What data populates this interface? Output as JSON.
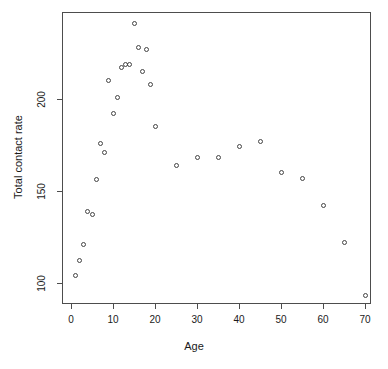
{
  "chart_data": {
    "type": "scatter",
    "title": "",
    "xlabel": "Age",
    "ylabel": "Total contact rate",
    "xlim": [
      -1.5,
      72.5
    ],
    "ylim": [
      88,
      245
    ],
    "grid": false,
    "legend": null,
    "xticks": [
      0,
      10,
      20,
      30,
      40,
      50,
      60,
      70
    ],
    "xtick_labels": [
      "0",
      "10",
      "20",
      "30",
      "40",
      "50",
      "60",
      "70"
    ],
    "yticks": [
      100,
      150,
      200
    ],
    "ytick_labels": [
      "100",
      "150",
      "200"
    ],
    "marker": "open-circle",
    "marker_color": "#444444",
    "points": [
      {
        "x": 1,
        "y": 104
      },
      {
        "x": 2,
        "y": 112
      },
      {
        "x": 3,
        "y": 121
      },
      {
        "x": 4,
        "y": 139
      },
      {
        "x": 5,
        "y": 137
      },
      {
        "x": 6,
        "y": 156
      },
      {
        "x": 7,
        "y": 176
      },
      {
        "x": 8,
        "y": 171
      },
      {
        "x": 9,
        "y": 210
      },
      {
        "x": 10,
        "y": 192
      },
      {
        "x": 11,
        "y": 201
      },
      {
        "x": 12,
        "y": 217
      },
      {
        "x": 13,
        "y": 219
      },
      {
        "x": 14,
        "y": 219
      },
      {
        "x": 15,
        "y": 241
      },
      {
        "x": 16,
        "y": 228
      },
      {
        "x": 17,
        "y": 215
      },
      {
        "x": 18,
        "y": 227
      },
      {
        "x": 19,
        "y": 208
      },
      {
        "x": 20,
        "y": 185
      },
      {
        "x": 25,
        "y": 164
      },
      {
        "x": 30,
        "y": 168
      },
      {
        "x": 35,
        "y": 168
      },
      {
        "x": 40,
        "y": 174
      },
      {
        "x": 45,
        "y": 177
      },
      {
        "x": 50,
        "y": 160
      },
      {
        "x": 55,
        "y": 157
      },
      {
        "x": 60,
        "y": 142
      },
      {
        "x": 65,
        "y": 122
      },
      {
        "x": 70,
        "y": 93
      }
    ]
  },
  "axes": {
    "frame_color": "#4d4d4d",
    "text_color": "#1a1a1a"
  }
}
